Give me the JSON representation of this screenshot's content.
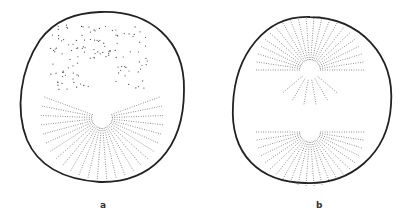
{
  "figure": {
    "panels": [
      {
        "id": "a",
        "label": "a",
        "description": "cell with scattered chromosomes above a single aster"
      },
      {
        "id": "b",
        "label": "b",
        "description": "cell with two asters forming a spindle"
      }
    ]
  }
}
